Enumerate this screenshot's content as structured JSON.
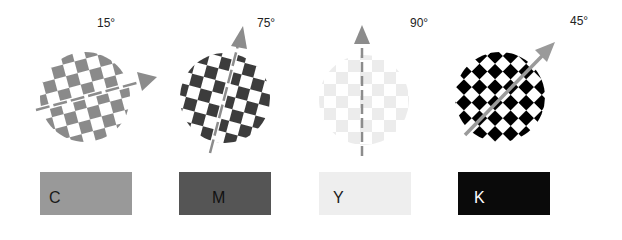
{
  "screens": [
    {
      "channel": "C",
      "angle_label": "15°",
      "angle_deg": 15,
      "dot_color": "#8a8a8a",
      "arrow_style": "dashed",
      "swatch": {
        "letter": "C",
        "fill": "#999999",
        "text_color": "#1a1a1a"
      }
    },
    {
      "channel": "M",
      "angle_label": "75°",
      "angle_deg": 75,
      "dot_color": "#3c3c3c",
      "arrow_style": "dashed",
      "swatch": {
        "letter": "M",
        "fill": "#555555",
        "text_color": "#111111"
      }
    },
    {
      "channel": "Y",
      "angle_label": "90°",
      "angle_deg": 90,
      "dot_color": "#ececec",
      "arrow_style": "dashed",
      "swatch": {
        "letter": "Y",
        "fill": "#eeeeee",
        "text_color": "#1a1a1a"
      }
    },
    {
      "channel": "K",
      "angle_label": "45°",
      "angle_deg": 45,
      "dot_color": "#000000",
      "arrow_style": "solid",
      "swatch": {
        "letter": "K",
        "fill": "#0a0a0a",
        "text_color": "#ffffff"
      }
    }
  ],
  "arrow_color": "#8c8c8c"
}
